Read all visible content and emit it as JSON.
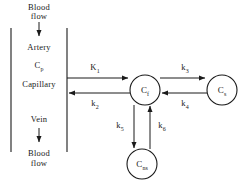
{
  "diagram": {
    "type": "compartment-model",
    "background_color": "#ffffff",
    "stroke_color": "#1a1a1a",
    "left_column": {
      "top_flow_label": "Blood\nflow",
      "top_flow_line1": "Blood",
      "top_flow_line2": "flow",
      "artery_label": "Artery",
      "plasma_label": "C",
      "plasma_sub": "p",
      "capillary_label": "Capillary",
      "vein_label": "Vein",
      "bottom_flow_line1": "Blood",
      "bottom_flow_line2": "flow"
    },
    "compartments": [
      {
        "id": "cf",
        "label": "C",
        "sub": "f",
        "cx": 145,
        "cy": 90,
        "r": 15
      },
      {
        "id": "cs",
        "label": "C",
        "sub": "s",
        "cx": 222,
        "cy": 90,
        "r": 15
      },
      {
        "id": "cns",
        "label": "C",
        "sub": "ns",
        "cx": 142,
        "cy": 164,
        "r": 15
      }
    ],
    "rate_constants": [
      {
        "id": "k1",
        "label": "K",
        "sub": "1",
        "x": 95,
        "y": 66,
        "direction": "right",
        "from": "capillary",
        "to": "cf"
      },
      {
        "id": "k2",
        "label": "k",
        "sub": "2",
        "x": 95,
        "y": 101,
        "direction": "left",
        "from": "cf",
        "to": "capillary"
      },
      {
        "id": "k3",
        "label": "k",
        "sub": "3",
        "x": 185,
        "y": 66,
        "direction": "right",
        "from": "cf",
        "to": "cs"
      },
      {
        "id": "k4",
        "label": "k",
        "sub": "4",
        "x": 185,
        "y": 101,
        "direction": "left",
        "from": "cs",
        "to": "cf"
      },
      {
        "id": "k5",
        "label": "k",
        "sub": "5",
        "x": 120,
        "y": 124,
        "direction": "down",
        "from": "cf",
        "to": "cns"
      },
      {
        "id": "k6",
        "label": "k",
        "sub": "6",
        "x": 157,
        "y": 124,
        "direction": "up",
        "from": "cns",
        "to": "cf"
      }
    ]
  }
}
